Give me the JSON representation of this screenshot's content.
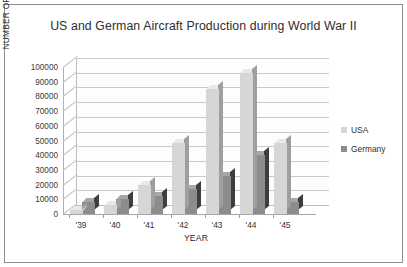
{
  "chart_data": {
    "type": "bar",
    "title": "US and German Aircraft Production during World War II",
    "xlabel": "YEAR",
    "ylabel": "NUMBER OF UNITS PRODUCED",
    "categories": [
      "'39",
      "'40",
      "'41",
      "'42",
      "'43",
      "'44",
      "'45"
    ],
    "series": [
      {
        "name": "USA",
        "color": "#d6d6d6",
        "values": [
          3000,
          6000,
          20000,
          48000,
          85000,
          96000,
          48000
        ]
      },
      {
        "name": "Germany",
        "color": "#8c8c8c",
        "values": [
          8000,
          10000,
          12000,
          17000,
          26000,
          40000,
          8000
        ]
      }
    ],
    "ylim": [
      0,
      100000
    ],
    "ytick_labels": [
      "100000",
      "90000",
      "80000",
      "70000",
      "60000",
      "50000",
      "40000",
      "30000",
      "20000",
      "10000",
      "0"
    ],
    "ytick_values": [
      100000,
      90000,
      80000,
      70000,
      60000,
      50000,
      40000,
      30000,
      20000,
      10000,
      0
    ],
    "grid": true,
    "legend_position": "right",
    "style": "3d-clustered-column"
  },
  "legend": {
    "entries": [
      {
        "label": "USA",
        "swatch": "#d6d6d6"
      },
      {
        "label": "Germany",
        "swatch": "#8c8c8c"
      }
    ]
  }
}
